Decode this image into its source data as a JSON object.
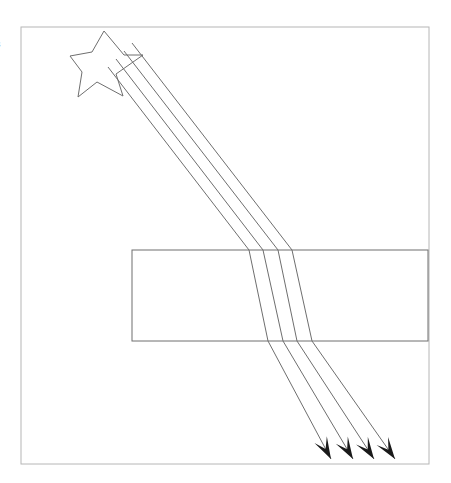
{
  "figure": {
    "background_color": "#ffffff",
    "stroke_color": "#6e6e6e",
    "frame_stroke_color": "#b6b6b6",
    "arrow_fill_color": "#1a1a1a",
    "width": 451,
    "height": 483
  },
  "edge_text": {
    "clipped_glyph": "s"
  },
  "frame": {
    "label": "diagram-border",
    "x": 21,
    "y": 27,
    "width": 408,
    "height": 437
  },
  "slab": {
    "label": "refracting-slab",
    "x": 132,
    "y": 250,
    "width": 296,
    "height": 91,
    "fill": "none"
  },
  "star": {
    "label": "light-source-star",
    "points": "104,31 124,55 143,55 116,74 123,96 97,82 78,97 82,72 70,56 92,52",
    "center_x": 105,
    "center_y": 63
  },
  "rays": {
    "count": 4,
    "incident_angle_note": "rays travel down-right before slab",
    "paths": [
      {
        "id": "ray-1",
        "start_x": 108,
        "start_y": 67,
        "enter_x": 249,
        "enter_y": 250,
        "exit_x": 268,
        "exit_y": 341,
        "tip_x": 331,
        "tip_y": 459
      },
      {
        "id": "ray-2",
        "start_x": 116,
        "start_y": 59,
        "enter_x": 263,
        "enter_y": 250,
        "exit_x": 283,
        "exit_y": 341,
        "tip_x": 353,
        "tip_y": 459
      },
      {
        "id": "ray-3",
        "start_x": 124,
        "start_y": 51,
        "enter_x": 278,
        "enter_y": 250,
        "exit_x": 297,
        "exit_y": 341,
        "tip_x": 374,
        "tip_y": 459
      },
      {
        "id": "ray-4",
        "start_x": 132,
        "start_y": 43,
        "enter_x": 292,
        "enter_y": 250,
        "exit_x": 312,
        "exit_y": 341,
        "tip_x": 395,
        "tip_y": 459
      }
    ]
  },
  "arrowheads": {
    "label": "ray-direction-arrowheads",
    "count": 4,
    "length": 22,
    "half_width": 7
  }
}
